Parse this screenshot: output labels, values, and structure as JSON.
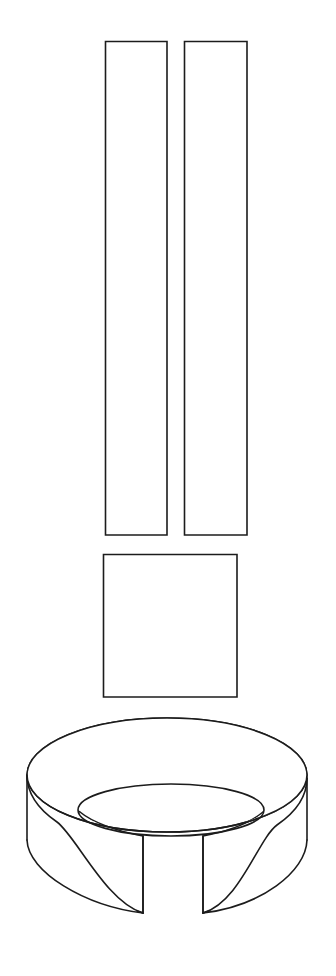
{
  "figure": {
    "background_color": "#ffffff",
    "line_color": "#1c1c1c",
    "line_width": 1.6,
    "canvas": {
      "width": 336,
      "height": 976
    },
    "style": "monochrome technical outline drawing, no shading, no labels, no text"
  },
  "parts": {
    "bar_left": {
      "name": "left-vertical-bar",
      "shape": "rectangle",
      "x": 105,
      "y": 41,
      "width": 62,
      "height": 494
    },
    "bar_right": {
      "name": "right-vertical-bar",
      "shape": "rectangle",
      "x": 184,
      "y": 41,
      "width": 63,
      "height": 494
    },
    "block": {
      "name": "middle-block",
      "shape": "rectangle",
      "x": 103,
      "y": 554,
      "width": 134,
      "height": 143
    },
    "ring": {
      "name": "split-ring-base",
      "shape": "split-ring-cylinder",
      "outer_center_x": 167,
      "outer_center_y": 775,
      "outer_rx": 140,
      "outer_ry": 57,
      "inner_center_x": 171,
      "inner_center_y": 810,
      "inner_rx": 93,
      "inner_ry": 26,
      "wall_height": 100,
      "notch_left_x": 143,
      "notch_right_x": 203,
      "notch_bottom_y": 913
    }
  },
  "geometry_paths": {
    "outer_top_ellipse": "M 27,775 C 27,743 90,718 167,718 C 244,718 307,743 307,775 C 307,807 244,832 167,832 C 90,832 27,807 27,775 Z",
    "inner_top_ellipse": "M 78,810 C 78,796 120,784 171,784 C 222,784 264,796 264,810 C 264,824 222,836 171,836 C 120,836 78,824 78,810 Z",
    "ring_body": "M 27,775 L 27,840 C 27,875 90,913 143,913 L 143,836 C 112,832 84,822 78,810 L 78,810 C 58,805 34,793 27,775 Z",
    "ring_body_right": "M 307,775 L 307,840 C 307,875 250,913 203,913 L 203,836 C 235,832 260,822 264,810 C 286,805 300,793 307,775 Z"
  }
}
